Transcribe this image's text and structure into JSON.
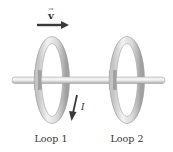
{
  "diagram": {
    "velocity": {
      "label": "v",
      "vector_mark": "→",
      "direction": "right"
    },
    "current": {
      "label": "I",
      "direction": "down"
    },
    "loops": [
      {
        "label": "Loop 1"
      },
      {
        "label": "Loop 2"
      }
    ],
    "colors": {
      "background": "#ffffff",
      "ring_light": "#f4f4f4",
      "ring_mid": "#d6d6d6",
      "ring_dark": "#a8a8a8",
      "rod": "#cfcfcf",
      "arrow": "#3a3a3a",
      "text": "#333333"
    }
  }
}
